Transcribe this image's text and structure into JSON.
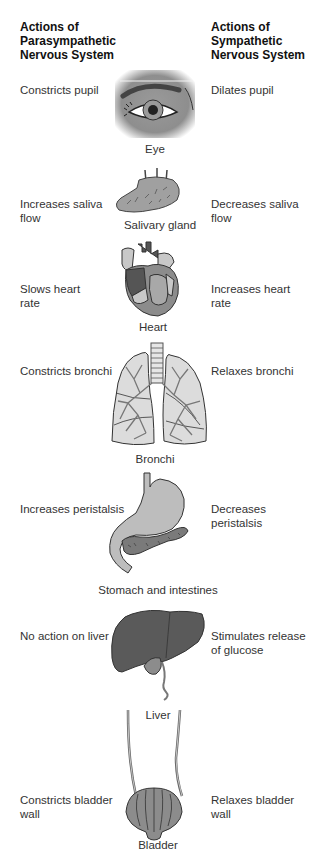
{
  "headers": {
    "left": "Actions of Parasympathetic Nervous System",
    "left_lines": [
      "Actions of",
      "Parasympathetic",
      "Nervous System"
    ],
    "right": "Actions of Sympathetic Nervous System",
    "right_lines": [
      "Actions of",
      "Sympathetic",
      "Nervous System"
    ]
  },
  "organs": [
    {
      "name": "Eye",
      "parasympathetic": "Constricts pupil",
      "sympathetic": "Dilates pupil",
      "icon": "eye-icon"
    },
    {
      "name": "Salivary gland",
      "parasympathetic": "Increases saliva flow",
      "sympathetic": "Decreases saliva flow",
      "icon": "salivary-gland-icon",
      "para_lines": [
        "Increases saliva",
        "flow"
      ],
      "symp_lines": [
        "Decreases saliva",
        "flow"
      ]
    },
    {
      "name": "Heart",
      "parasympathetic": "Slows heart rate",
      "sympathetic": "Increases heart rate",
      "icon": "heart-icon",
      "para_lines": [
        "Slows heart",
        "rate"
      ],
      "symp_lines": [
        "Increases heart",
        "rate"
      ]
    },
    {
      "name": "Bronchi",
      "parasympathetic": "Constricts bronchi",
      "sympathetic": "Relaxes bronchi",
      "icon": "lungs-icon"
    },
    {
      "name": "Stomach and intestines",
      "parasympathetic": "Increases peristalsis",
      "sympathetic": "Decreases peristalsis",
      "icon": "stomach-icon"
    },
    {
      "name": "Liver",
      "parasympathetic": "No action on liver",
      "sympathetic": "Stimulates release of glucose",
      "icon": "liver-icon",
      "symp_lines": [
        "Stimulates release",
        "of glucose"
      ]
    },
    {
      "name": "Bladder",
      "parasympathetic": "Constricts bladder wall",
      "sympathetic": "Relaxes bladder wall",
      "icon": "bladder-icon",
      "para_lines": [
        "Constricts bladder",
        "wall"
      ],
      "symp_lines": [
        "Relaxes bladder",
        "wall"
      ]
    }
  ],
  "colors": {
    "organ_dark": "#5a5a5a",
    "organ_mid": "#8c8c8c",
    "organ_light": "#c8c8c8",
    "lung_fill": "#dcdcdc",
    "text": "#333333"
  }
}
